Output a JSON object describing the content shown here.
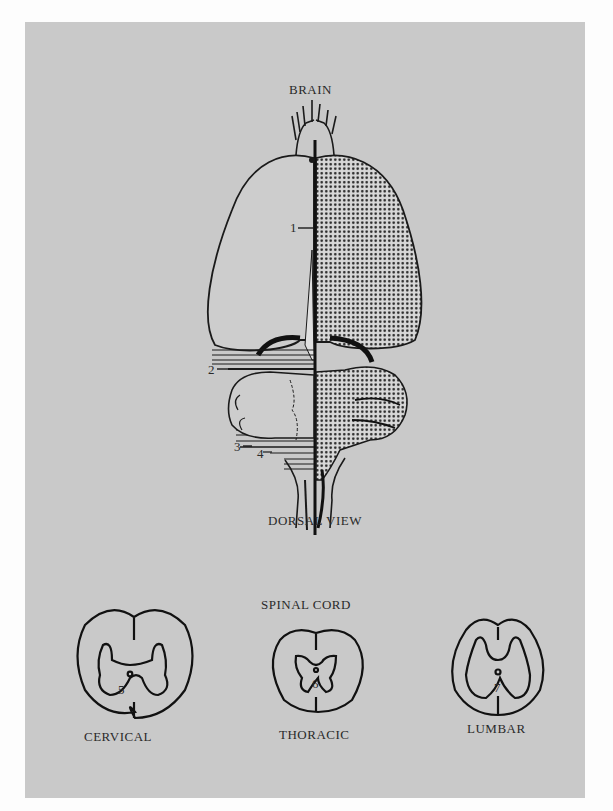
{
  "figure": {
    "brain": {
      "title": "BRAIN",
      "view_label": "DORSAL VIEW",
      "markers": [
        {
          "id": "1",
          "label": "1"
        },
        {
          "id": "2",
          "label": "2"
        },
        {
          "id": "3",
          "label": "3"
        },
        {
          "id": "4",
          "label": "4"
        }
      ]
    },
    "spinal_cord": {
      "title": "SPINAL CORD",
      "sections": [
        {
          "name": "CERVICAL",
          "marker": "5"
        },
        {
          "name": "THORACIC",
          "marker": "6"
        },
        {
          "name": "LUMBAR",
          "marker": "7"
        }
      ]
    },
    "colors": {
      "page": "#fdfdfd",
      "plate": "#c9c9c9",
      "ink": "#1a1a1a"
    }
  }
}
